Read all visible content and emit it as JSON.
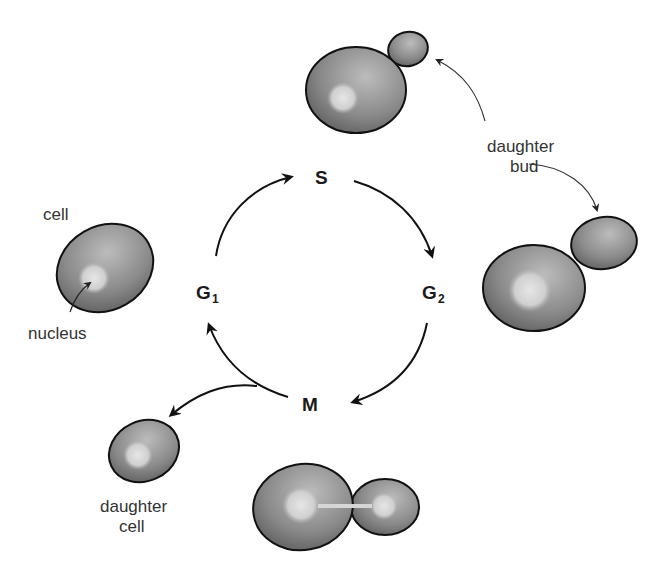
{
  "diagram": {
    "phases": {
      "s": {
        "label": "S"
      },
      "g2": {
        "label": "G",
        "sub": "2"
      },
      "m": {
        "label": "M"
      },
      "g1": {
        "label": "G",
        "sub": "1"
      }
    },
    "labels": {
      "cell": "cell",
      "nucleus": "nucleus",
      "daughter_bud_line1": "daughter",
      "daughter_bud_line2": "bud",
      "daughter_cell_line1": "daughter",
      "daughter_cell_line2": "cell"
    },
    "colors": {
      "cell_dark": "#5a5a5a",
      "cell_light": "#bdbdbd",
      "nucleus": "#d8d8d8",
      "outline": "#111111"
    }
  }
}
